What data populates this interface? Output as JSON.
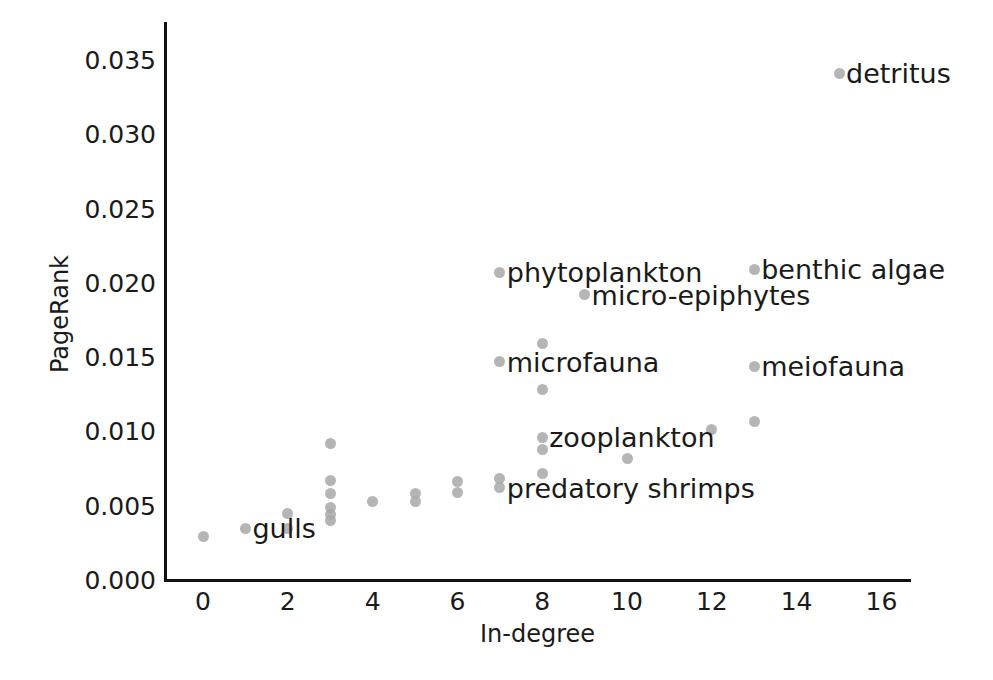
{
  "chart_data": {
    "type": "scatter",
    "title": "",
    "xlabel": "In-degree",
    "ylabel": "PageRank",
    "xlim": [
      -0.9,
      16.7
    ],
    "ylim": [
      0.0,
      0.0375
    ],
    "grid": false,
    "legend": null,
    "xticks": [
      "0",
      "2",
      "4",
      "6",
      "8",
      "10",
      "12",
      "14",
      "16"
    ],
    "xtick_values": [
      0,
      2,
      4,
      6,
      8,
      10,
      12,
      14,
      16
    ],
    "yticks": [
      "0.000",
      "0.005",
      "0.010",
      "0.015",
      "0.020",
      "0.025",
      "0.030",
      "0.035"
    ],
    "ytick_values": [
      0.0,
      0.005,
      0.01,
      0.015,
      0.02,
      0.025,
      0.03,
      0.035
    ],
    "marker_color": "#a8a8a8",
    "axis_color": "#111111",
    "points": [
      {
        "x": 0,
        "y": 0.0029,
        "label": null
      },
      {
        "x": 1,
        "y": 0.0035,
        "label": "gulls"
      },
      {
        "x": 2,
        "y": 0.0045,
        "label": null
      },
      {
        "x": 2,
        "y": 0.0035,
        "label": null
      },
      {
        "x": 3,
        "y": 0.0092,
        "label": null
      },
      {
        "x": 3,
        "y": 0.0067,
        "label": null
      },
      {
        "x": 3,
        "y": 0.0058,
        "label": null
      },
      {
        "x": 3,
        "y": 0.0049,
        "label": null
      },
      {
        "x": 3,
        "y": 0.0044,
        "label": null
      },
      {
        "x": 3,
        "y": 0.004,
        "label": null
      },
      {
        "x": 4,
        "y": 0.0053,
        "label": null
      },
      {
        "x": 5,
        "y": 0.0058,
        "label": null
      },
      {
        "x": 5,
        "y": 0.0053,
        "label": null
      },
      {
        "x": 6,
        "y": 0.0066,
        "label": null
      },
      {
        "x": 6,
        "y": 0.0059,
        "label": null
      },
      {
        "x": 7,
        "y": 0.0207,
        "label": "phytoplankton"
      },
      {
        "x": 7,
        "y": 0.0147,
        "label": "microfauna"
      },
      {
        "x": 7,
        "y": 0.0068,
        "label": null
      },
      {
        "x": 7,
        "y": 0.0062,
        "label": "predatory shrimps"
      },
      {
        "x": 8,
        "y": 0.0159,
        "label": null
      },
      {
        "x": 8,
        "y": 0.0128,
        "label": null
      },
      {
        "x": 8,
        "y": 0.0096,
        "label": "zooplankton"
      },
      {
        "x": 8,
        "y": 0.0088,
        "label": null
      },
      {
        "x": 8,
        "y": 0.0072,
        "label": null
      },
      {
        "x": 9,
        "y": 0.0192,
        "label": "micro-epiphytes"
      },
      {
        "x": 10,
        "y": 0.0082,
        "label": null
      },
      {
        "x": 12,
        "y": 0.0101,
        "label": null
      },
      {
        "x": 13,
        "y": 0.0209,
        "label": "benthic algae"
      },
      {
        "x": 13,
        "y": 0.0144,
        "label": "meiofauna"
      },
      {
        "x": 13,
        "y": 0.0107,
        "label": null
      },
      {
        "x": 15,
        "y": 0.0341,
        "label": "detritus"
      }
    ],
    "annotations": [
      {
        "text": "detritus",
        "x": 15,
        "y": 0.0341
      },
      {
        "text": "phytoplankton",
        "x": 7,
        "y": 0.0207
      },
      {
        "text": "benthic algae",
        "x": 13,
        "y": 0.0209
      },
      {
        "text": "micro-epiphytes",
        "x": 9,
        "y": 0.0192
      },
      {
        "text": "microfauna",
        "x": 7,
        "y": 0.0147
      },
      {
        "text": "meiofauna",
        "x": 13,
        "y": 0.0144
      },
      {
        "text": "zooplankton",
        "x": 8,
        "y": 0.0096
      },
      {
        "text": "predatory shrimps",
        "x": 7,
        "y": 0.0062
      },
      {
        "text": "gulls",
        "x": 1,
        "y": 0.0035
      }
    ]
  }
}
